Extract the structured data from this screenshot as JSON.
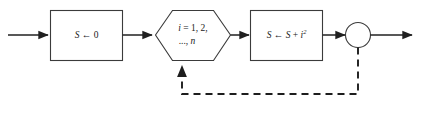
{
  "diagram": {
    "background_color": "#ffffff",
    "line_color": "#202020",
    "shape_stroke_color": "#3b3b3b",
    "shape_fill_color": "#ffffff",
    "nodes": {
      "init_box": {
        "type": "process-rectangle",
        "text": "S ← 0",
        "variable": "S",
        "arrow": "←",
        "value": "0"
      },
      "loop_hexagon": {
        "type": "loop-hexagon",
        "line1": "i = 1, 2,",
        "line2": "..., n",
        "index_variable": "i",
        "start": "1",
        "end": "n"
      },
      "accumulate_box": {
        "type": "process-rectangle",
        "text": "S ← S + i²",
        "lhs": "S",
        "arrow": "←",
        "rhs_first": "S",
        "rhs_operator": "+",
        "rhs_second": "i",
        "rhs_exponent": "2"
      },
      "junction_circle": {
        "type": "connector-circle",
        "text": ""
      }
    },
    "edges": {
      "input_arrow": {
        "style": "solid",
        "label": ""
      },
      "init_to_loop": {
        "style": "solid",
        "label": ""
      },
      "loop_to_accumulate": {
        "style": "solid",
        "label": ""
      },
      "accumulate_to_junction": {
        "style": "solid",
        "label": ""
      },
      "output_arrow": {
        "style": "solid",
        "label": ""
      },
      "feedback_loop": {
        "style": "dashed",
        "label": ""
      }
    }
  }
}
